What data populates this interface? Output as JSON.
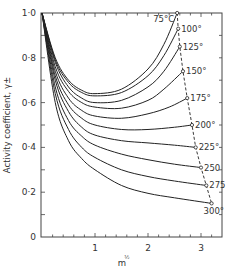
{
  "chart_data": {
    "type": "line",
    "title": "",
    "xlabel": "m^1/2",
    "ylabel": "Activity coefficient, γ±",
    "xlim": [
      0,
      3.4
    ],
    "ylim": [
      0,
      1.0
    ],
    "x_ticks": [
      1,
      2,
      3
    ],
    "x_tick_labels": [
      "1",
      "2",
      "3"
    ],
    "y_ticks": [
      0,
      0.2,
      0.4,
      0.6,
      0.8,
      1.0
    ],
    "y_tick_labels": [
      "0",
      "0·2",
      "0·4",
      "0·6",
      "0·8",
      "1·0"
    ],
    "grid": false,
    "legend": "inline labels at curve ends",
    "annotation": "dashed line connecting curve endpoints (saturation)",
    "series": [
      {
        "name": "75°C",
        "label": "75°C",
        "x": [
          0,
          0.25,
          0.5,
          0.75,
          1.0,
          1.5,
          2.0,
          2.3,
          2.55
        ],
        "values": [
          1.0,
          0.8,
          0.7,
          0.655,
          0.64,
          0.66,
          0.75,
          0.86,
          1.0
        ]
      },
      {
        "name": "100°",
        "label": "100°",
        "x": [
          0,
          0.25,
          0.5,
          0.75,
          1.0,
          1.5,
          2.0,
          2.3,
          2.57
        ],
        "values": [
          1.0,
          0.79,
          0.69,
          0.645,
          0.63,
          0.645,
          0.72,
          0.81,
          0.93
        ]
      },
      {
        "name": "125°",
        "label": "125°",
        "x": [
          0,
          0.25,
          0.5,
          0.75,
          1.0,
          1.5,
          2.0,
          2.3,
          2.6
        ],
        "values": [
          1.0,
          0.78,
          0.67,
          0.62,
          0.6,
          0.61,
          0.67,
          0.74,
          0.85
        ]
      },
      {
        "name": "150°",
        "label": "150°",
        "x": [
          0,
          0.25,
          0.5,
          0.75,
          1.0,
          1.5,
          2.0,
          2.3,
          2.66
        ],
        "values": [
          1.0,
          0.76,
          0.65,
          0.6,
          0.58,
          0.575,
          0.61,
          0.66,
          0.74
        ]
      },
      {
        "name": "175°",
        "label": "175°",
        "x": [
          0,
          0.25,
          0.5,
          0.75,
          1.0,
          1.5,
          2.0,
          2.4,
          2.74
        ],
        "values": [
          1.0,
          0.74,
          0.62,
          0.565,
          0.54,
          0.53,
          0.55,
          0.58,
          0.62
        ]
      },
      {
        "name": "200°",
        "label": "200°",
        "x": [
          0,
          0.25,
          0.5,
          0.75,
          1.0,
          1.5,
          2.0,
          2.5,
          2.83
        ],
        "values": [
          1.0,
          0.72,
          0.59,
          0.53,
          0.5,
          0.48,
          0.48,
          0.49,
          0.5
        ]
      },
      {
        "name": "225°",
        "label": "225°",
        "x": [
          0,
          0.25,
          0.5,
          0.75,
          1.0,
          1.5,
          2.0,
          2.5,
          2.9
        ],
        "values": [
          1.0,
          0.7,
          0.56,
          0.49,
          0.455,
          0.43,
          0.42,
          0.41,
          0.4
        ]
      },
      {
        "name": "250",
        "label": "250",
        "x": [
          0,
          0.25,
          0.5,
          0.75,
          1.0,
          1.5,
          2.0,
          2.5,
          3.0
        ],
        "values": [
          1.0,
          0.67,
          0.52,
          0.45,
          0.41,
          0.37,
          0.345,
          0.325,
          0.31
        ]
      },
      {
        "name": "275",
        "label": "275",
        "x": [
          0,
          0.25,
          0.5,
          0.75,
          1.0,
          1.5,
          2.0,
          2.5,
          3.1
        ],
        "values": [
          1.0,
          0.64,
          0.48,
          0.4,
          0.355,
          0.3,
          0.27,
          0.25,
          0.23
        ]
      },
      {
        "name": "300°",
        "label": "300°",
        "x": [
          0,
          0.25,
          0.5,
          0.75,
          1.0,
          1.5,
          2.0,
          2.5,
          3.2
        ],
        "values": [
          1.0,
          0.6,
          0.43,
          0.35,
          0.3,
          0.23,
          0.195,
          0.175,
          0.15
        ]
      }
    ]
  }
}
